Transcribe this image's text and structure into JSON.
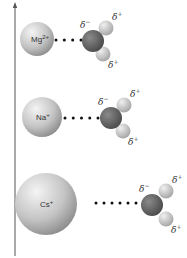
{
  "diagram": {
    "axis": {
      "direction": "up",
      "label": ""
    },
    "rows": [
      {
        "ion": {
          "symbol": "Mg",
          "charge": "2+",
          "cx": 37,
          "cy": 39,
          "r": 17
        },
        "bond": {
          "dots": 4,
          "x1": 56,
          "x2": 81,
          "y": 40
        },
        "water": {
          "ox": 93,
          "oy": 41,
          "h1x": 106,
          "h1y": 28,
          "h2x": 103,
          "h2y": 54
        },
        "labels": {
          "oxygen": "δ",
          "oxygen_charge": "−",
          "h1": "δ",
          "h1_charge": "+",
          "h2": "δ",
          "h2_charge": "+"
        }
      },
      {
        "ion": {
          "symbol": "Na",
          "charge": "+",
          "cx": 42,
          "cy": 117,
          "r": 20
        },
        "bond": {
          "dots": 5,
          "x1": 65,
          "x2": 98,
          "y": 118
        },
        "water": {
          "ox": 111,
          "oy": 118,
          "h1x": 124,
          "h1y": 105,
          "h2x": 123,
          "h2y": 131
        },
        "labels": {
          "oxygen": "δ",
          "oxygen_charge": "−",
          "h1": "δ",
          "h1_charge": "+",
          "h2": "δ",
          "h2_charge": "+"
        }
      },
      {
        "ion": {
          "symbol": "Cs",
          "charge": "+",
          "cx": 46,
          "cy": 204,
          "r": 31
        },
        "bond": {
          "dots": 6,
          "x1": 96,
          "x2": 136,
          "y": 203
        },
        "water": {
          "ox": 152,
          "oy": 205,
          "h1x": 166,
          "h1y": 191,
          "h2x": 166,
          "h2y": 219
        },
        "labels": {
          "oxygen": "δ",
          "oxygen_charge": "−",
          "h1": "δ",
          "h1_charge": "+",
          "h2": "δ",
          "h2_charge": "+"
        }
      }
    ],
    "colors": {
      "ion": "#c8c8c8",
      "oxygen": "#6a6a6a",
      "hydrogen": "#d9d9d9",
      "dots": "#111111",
      "axis": "#555555"
    }
  }
}
